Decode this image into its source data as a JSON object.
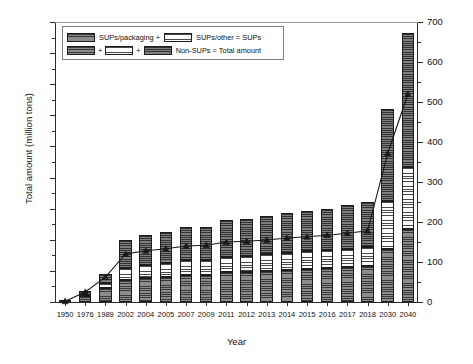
{
  "chart_data": {
    "type": "bar",
    "title": "",
    "xlabel": "Year",
    "ylabel": "Total amount (million tons)",
    "y2label": "Waste plastic collection amount (million tons)",
    "ylim": [
      0,
      900
    ],
    "y2lim": [
      0,
      700
    ],
    "ytick_step": 100,
    "y2tick_step": 100,
    "grid": false,
    "stacked": true,
    "legend_position": "top-left",
    "categories": [
      "1950",
      "1976",
      "1989",
      "2002",
      "2004",
      "2005",
      "2007",
      "2009",
      "2011",
      "2012",
      "2013",
      "2014",
      "2015",
      "2016",
      "2017",
      "2018",
      "2030",
      "2040"
    ],
    "yticks": [
      "0",
      "100",
      "200",
      "300",
      "400",
      "500",
      "600",
      "700",
      "800",
      "900"
    ],
    "y2ticks": [
      "0",
      "100",
      "200",
      "300",
      "400",
      "500",
      "600",
      "700"
    ],
    "series": [
      {
        "name": "SUPs/packaging",
        "axis": "left",
        "values": [
          1,
          18,
          45,
          72,
          78,
          82,
          88,
          88,
          95,
          97,
          100,
          103,
          106,
          108,
          112,
          115,
          170,
          235
        ]
      },
      {
        "name": "SUPs/other",
        "axis": "left",
        "values": [
          0,
          6,
          15,
          38,
          42,
          44,
          47,
          47,
          51,
          52,
          54,
          55,
          57,
          58,
          60,
          62,
          155,
          200
        ]
      },
      {
        "name": "Non-SUPs",
        "axis": "left",
        "values": [
          1,
          11,
          30,
          88,
          95,
          99,
          107,
          107,
          117,
          119,
          123,
          127,
          131,
          134,
          139,
          143,
          297,
          430
        ]
      }
    ],
    "totals": [
      2,
      35,
      90,
      198,
      215,
      225,
      242,
      242,
      263,
      268,
      277,
      285,
      294,
      300,
      311,
      320,
      622,
      865
    ],
    "line_series": {
      "name": "Waste plastic collection amount",
      "axis": "right",
      "marker": "triangle",
      "values": [
        2,
        25,
        62,
        120,
        128,
        133,
        140,
        142,
        150,
        152,
        155,
        160,
        163,
        167,
        172,
        178,
        372,
        520
      ]
    },
    "legend": {
      "row1": {
        "swatch1": "SUPs/packaging",
        "plus1": "+",
        "swatch2": "SUPs/other",
        "text_a": "SUPs/packaging +",
        "text_b": "SUPs/other = SUPs"
      },
      "row2": {
        "plus_a": "+",
        "plus_b": "+",
        "text": "Non-SUPs = Total amount"
      }
    },
    "icons": {
      "swatch_packaging": "hatch-dark-swatch",
      "swatch_other": "hatch-light-swatch",
      "swatch_nonsups": "hatch-medium-swatch",
      "line_marker": "triangle-marker"
    },
    "colors": {
      "packaging": "#7b7b7b",
      "other": "#f2f2f2",
      "nonsups": "#6e6e6e",
      "line": "#1a1a1a",
      "axis": "#2b2b2b"
    }
  }
}
